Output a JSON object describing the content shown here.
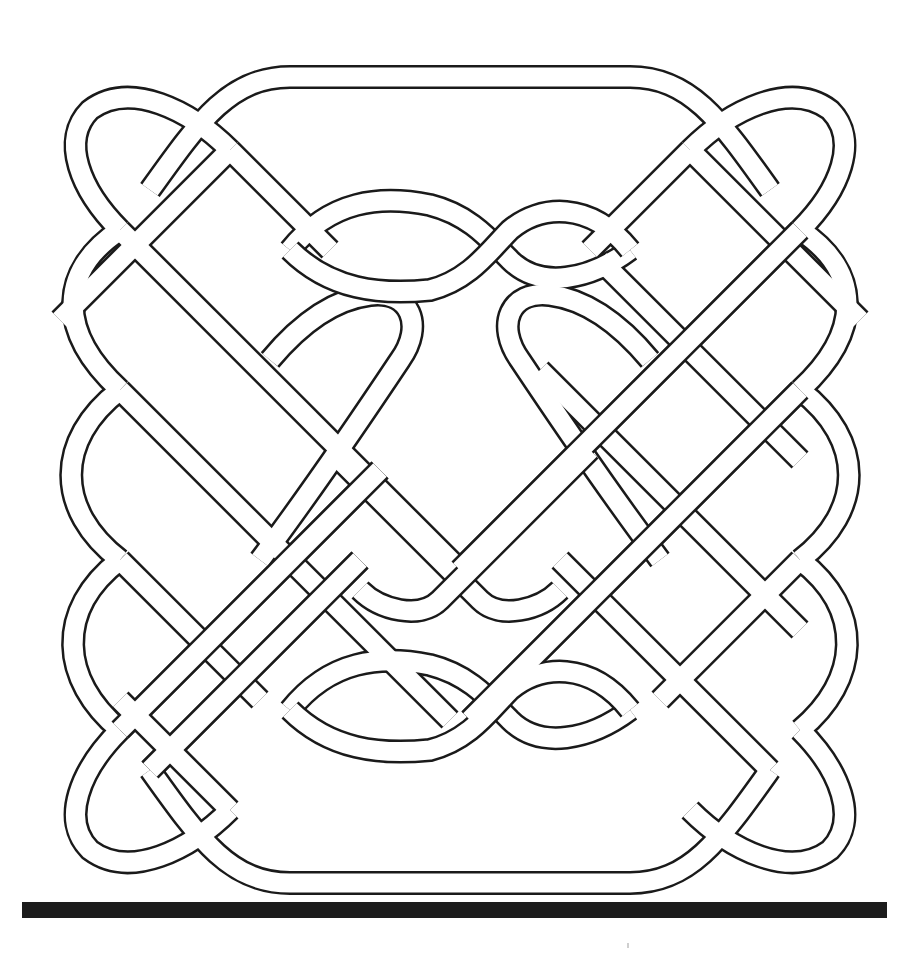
{
  "figure": {
    "colors": {
      "background": "#ffffff",
      "line": "#1a1a1a",
      "rule": "#1c1c1c"
    },
    "rule": {
      "x": 22,
      "y": 902,
      "width": 865,
      "height": 16
    },
    "speck": {
      "x": 627,
      "y": 943
    }
  }
}
